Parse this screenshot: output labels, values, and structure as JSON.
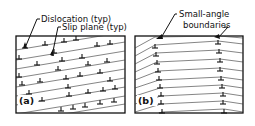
{
  "diagram": {
    "panel_a": {
      "label": "(a)",
      "annotations": {
        "dislocation": "Dislocation (typ)",
        "slip_plane": "Slip plane (typ)"
      },
      "description": "Randomly distributed edge dislocations on inclined slip planes"
    },
    "panel_b": {
      "label": "(b)",
      "annotations": {
        "boundaries_line1": "Small-angle",
        "boundaries_line2": "boundaries"
      },
      "description": "Dislocations arranged into vertical small-angle boundaries (polygonization)"
    },
    "colors": {
      "ink": "#111111",
      "background": "#ffffff"
    }
  }
}
